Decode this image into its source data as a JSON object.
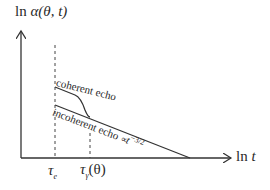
{
  "diagram": {
    "y_axis_label_prefix": "ln ",
    "y_axis_label_symbol": "α(θ, t)",
    "x_axis_label_prefix": "ln ",
    "x_axis_label_symbol": "t",
    "ticks": [
      {
        "symbol": "τ",
        "subscript": "e",
        "suffix": ""
      },
      {
        "symbol": "τ",
        "subscript": "γ",
        "suffix": "(θ)"
      }
    ],
    "curves": {
      "coherent_label": "coherent echo",
      "incoherent_label": "incoherent echo",
      "incoherent_scaling_prefix": "∝",
      "incoherent_scaling_base": "t",
      "incoherent_scaling_exponent": "−3/2"
    },
    "colors": {
      "line": "#333333",
      "background": "#ffffff"
    }
  }
}
